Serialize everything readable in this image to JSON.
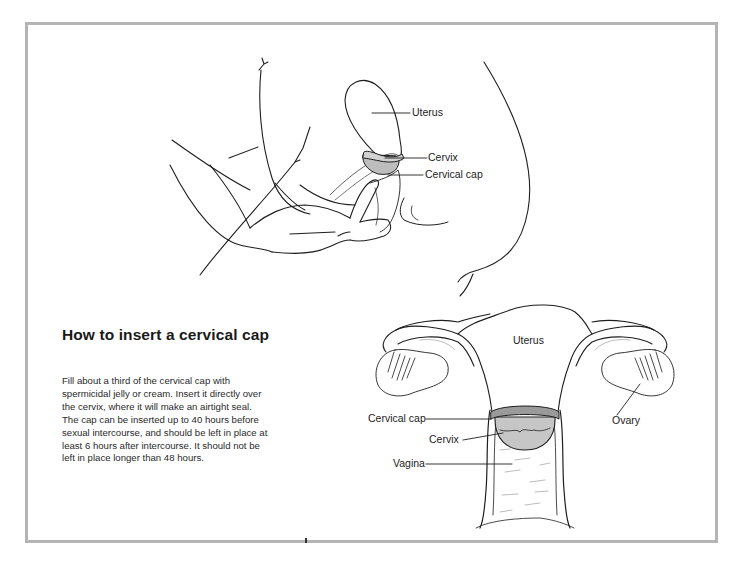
{
  "section": {
    "title": "How to insert a cervical cap",
    "body_lines": [
      "Fill about a third of the cervical cap with",
      "spermicidal jelly or cream. Insert it directly over",
      "the cervix, where it will make an airtight seal.",
      "The cap can be inserted up to 40 hours before",
      "sexual intercourse, and should be left in place at",
      "least 6 hours after intercourse. It should not be",
      "left in place longer than 48 hours."
    ]
  },
  "figure_side_view": {
    "labels": {
      "uterus": "Uterus",
      "cervix": "Cervix",
      "cervical_cap": "Cervical cap"
    }
  },
  "figure_front_view": {
    "labels": {
      "uterus": "Uterus",
      "cervical_cap": "Cervical cap",
      "cervix": "Cervix",
      "vagina": "Vagina",
      "ovary": "Ovary"
    }
  },
  "colors": {
    "frame_border": "#b4b4b4",
    "cap_fill": "#c8c8c8",
    "line": "#1e1e1e"
  }
}
